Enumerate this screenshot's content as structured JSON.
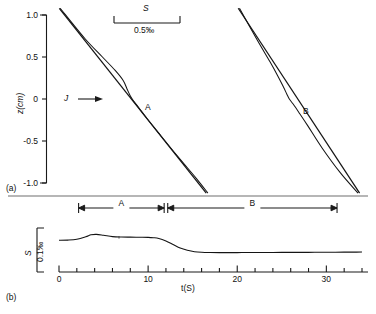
{
  "figure": {
    "panel_a": {
      "tag": "(a)",
      "y_axis": {
        "label": "z(cm)",
        "ticks": [
          "1.0",
          "0.5",
          "0",
          "-0.5",
          "-1.0"
        ],
        "values": [
          1.0,
          0.5,
          0,
          -0.5,
          -1.0
        ],
        "range": [
          -1.0,
          1.0
        ]
      },
      "scale_bar": {
        "symbol": "S",
        "value": "0.5‰"
      },
      "flux_arrow_label": "J",
      "curve_labels": [
        "A",
        "B"
      ]
    },
    "panel_b": {
      "tag": "(b)",
      "y_axis": {
        "label": "S",
        "scale": "0.1‰"
      },
      "x_axis": {
        "label": "t(S)",
        "ticks": [
          "0",
          "10",
          "20",
          "30"
        ],
        "values": [
          0,
          10,
          20,
          30
        ],
        "minor_step": 2,
        "range": [
          0,
          34
        ]
      },
      "interval_markers": [
        {
          "label": "A",
          "start": 2.2,
          "end": 11.8
        },
        {
          "label": "B",
          "start": 12.2,
          "end": 31.2
        }
      ]
    }
  },
  "chart_data": [
    {
      "type": "line",
      "id": "panel-a-profiles",
      "title": "",
      "xlabel": "S (relative, ‰)",
      "ylabel": "z(cm)",
      "ylim": [
        -1.0,
        1.0
      ],
      "xlim": [
        0,
        1
      ],
      "grid": false,
      "legend": "inline-labels",
      "annotations": [
        {
          "text": "S",
          "kind": "scale-bar-symbol"
        },
        {
          "text": "0.5‰",
          "kind": "scale-bar-value"
        },
        {
          "text": "J",
          "kind": "flux-arrow"
        },
        {
          "text": "A",
          "kind": "curve-group-label"
        },
        {
          "text": "B",
          "kind": "curve-group-label"
        }
      ],
      "series": [
        {
          "name": "A-straight",
          "comment": "linear reference profile, group A",
          "points": [
            [
              0.04,
              1.08
            ],
            [
              0.5,
              -1.12
            ]
          ]
        },
        {
          "name": "A-sigmoid",
          "comment": "S-shaped measured profile, group A",
          "points": [
            [
              0.043,
              1.08
            ],
            [
              0.12,
              0.72
            ],
            [
              0.175,
              0.5
            ],
            [
              0.215,
              0.34
            ],
            [
              0.24,
              0.22
            ],
            [
              0.252,
              0.12
            ],
            [
              0.262,
              0.04
            ],
            [
              0.272,
              -0.02
            ],
            [
              0.288,
              -0.1
            ],
            [
              0.312,
              -0.22
            ],
            [
              0.35,
              -0.4
            ],
            [
              0.41,
              -0.68
            ],
            [
              0.47,
              -0.95
            ],
            [
              0.505,
              -1.12
            ]
          ]
        },
        {
          "name": "B-straight",
          "comment": "linear reference profile, group B",
          "points": [
            [
              0.6,
              1.08
            ],
            [
              0.98,
              -1.12
            ]
          ]
        },
        {
          "name": "B-sigmoid",
          "comment": "S-shaped measured profile, group B",
          "points": [
            [
              0.604,
              1.08
            ],
            [
              0.66,
              0.7
            ],
            [
              0.7,
              0.44
            ],
            [
              0.726,
              0.26
            ],
            [
              0.742,
              0.14
            ],
            [
              0.752,
              0.06
            ],
            [
              0.76,
              0.0
            ],
            [
              0.772,
              -0.06
            ],
            [
              0.79,
              -0.16
            ],
            [
              0.818,
              -0.32
            ],
            [
              0.862,
              -0.58
            ],
            [
              0.92,
              -0.88
            ],
            [
              0.975,
              -1.12
            ]
          ]
        }
      ]
    },
    {
      "type": "line",
      "id": "panel-b-salinity-timeseries",
      "title": "",
      "xlabel": "t(S)",
      "ylabel": "S",
      "xlim": [
        0,
        34
      ],
      "ylim": [
        0,
        1
      ],
      "yscale_note": "0.1‰ bar",
      "grid": false,
      "series": [
        {
          "name": "S(t)",
          "x": [
            0,
            1,
            2,
            3,
            3.6,
            4.2,
            5,
            6,
            7,
            8,
            9,
            10,
            10.6,
            11.2,
            12,
            12.8,
            13.6,
            14.4,
            15.2,
            16,
            17,
            18,
            19,
            20,
            21,
            22,
            23,
            24,
            25,
            26,
            27,
            28,
            29,
            30,
            31,
            32,
            33,
            34
          ],
          "y": [
            0.72,
            0.725,
            0.745,
            0.8,
            0.845,
            0.855,
            0.835,
            0.805,
            0.795,
            0.792,
            0.79,
            0.788,
            0.78,
            0.762,
            0.705,
            0.625,
            0.545,
            0.495,
            0.462,
            0.448,
            0.442,
            0.44,
            0.44,
            0.441,
            0.442,
            0.443,
            0.443,
            0.444,
            0.445,
            0.446,
            0.447,
            0.447,
            0.448,
            0.449,
            0.45,
            0.451,
            0.452,
            0.453
          ]
        }
      ]
    }
  ]
}
